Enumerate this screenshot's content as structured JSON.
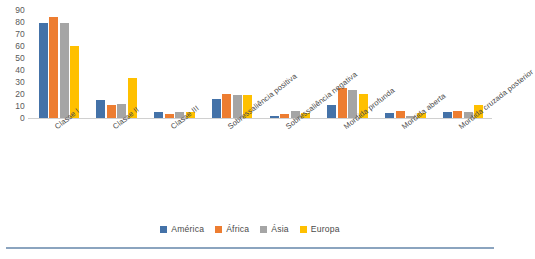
{
  "chart_data": {
    "type": "bar",
    "title": "",
    "subtitle": "",
    "xlabel": "",
    "ylabel": "",
    "ylim": [
      0,
      90
    ],
    "yticks": [
      0,
      10,
      20,
      30,
      40,
      50,
      60,
      70,
      80,
      90
    ],
    "grid": false,
    "legend_position": "bottom",
    "categories": [
      "Classe I",
      "Classe II",
      "Classe III",
      "Sobressaliência positiva",
      "Sobressaliência negativa",
      "Mordida profunda",
      "Mordida aberta",
      "Mordida cruzada posterior"
    ],
    "series": [
      {
        "name": "América",
        "color": "#4472A8",
        "values": [
          79,
          15,
          5,
          16,
          2,
          11,
          4,
          5
        ]
      },
      {
        "name": "África",
        "color": "#ED7D31",
        "values": [
          84,
          11,
          3,
          20,
          3,
          25,
          6,
          6
        ]
      },
      {
        "name": "Ásia",
        "color": "#A5A5A5",
        "values": [
          79,
          12,
          5,
          19,
          6,
          23,
          2,
          5
        ]
      },
      {
        "name": "Europa",
        "color": "#FFC000",
        "values": [
          60,
          33,
          5,
          19,
          4,
          20,
          4,
          11
        ]
      }
    ]
  },
  "colors": {
    "america": "#4472A8",
    "africa": "#ED7D31",
    "asia": "#A5A5A5",
    "europa": "#FFC000",
    "axis": "#d0d0d0",
    "tick_text": "#595959",
    "rule": "#8ba4bf"
  }
}
